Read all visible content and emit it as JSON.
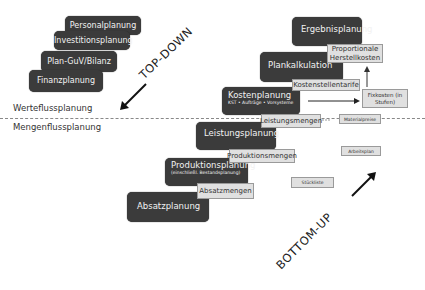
{
  "top_down": {
    "label": "TOP-DOWN",
    "boxes": [
      "Personalplanung",
      "Investitionsplanung",
      "Plan-GuV/Bilanz",
      "Finanzplanung"
    ]
  },
  "levels": {
    "werteflussplanung": "Werteflussplanung",
    "mengenflussplanung": "Mengenflussplanung"
  },
  "bottom_up": {
    "label": "BOTTOM-UP",
    "steps": [
      {
        "title": "Ergebnisplanung",
        "sub": ""
      },
      {
        "title": "Plankalkulation",
        "sub": ""
      },
      {
        "title": "Kostenplanung",
        "sub": "KST • Aufträge • Vorsysteme"
      },
      {
        "title": "Leistungsplanung",
        "sub": ""
      },
      {
        "title": "Produktionsplanung",
        "sub": "(einschließl. Bestandsplanung)"
      },
      {
        "title": "Absatzplanung",
        "sub": ""
      }
    ],
    "outputs": [
      "Proportionale Herstellkosten",
      "Kostenstellentarife",
      "Leistungsmengen",
      "Produktionsmengen",
      "Absatzmengen"
    ],
    "side": [
      "Fixkosten (in Stufen)",
      "Materialpreise",
      "Arbeitsplan",
      "Stückliste"
    ]
  }
}
